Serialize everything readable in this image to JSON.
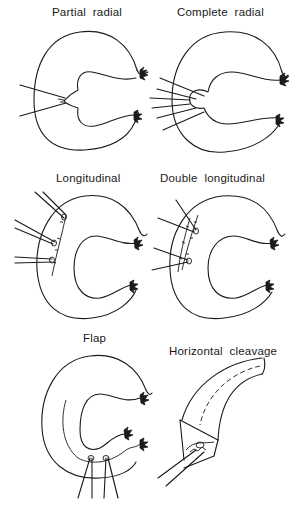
{
  "figure": {
    "panels": [
      {
        "id": "partial-radial",
        "label": "Partial  radial"
      },
      {
        "id": "complete-radial",
        "label": "Complete  radial"
      },
      {
        "id": "longitudinal",
        "label": "Longitudinal"
      },
      {
        "id": "double-longitudinal",
        "label": "Double  longitudinal"
      },
      {
        "id": "flap",
        "label": "Flap"
      },
      {
        "id": "horizontal-cleavage",
        "label": "Horizontal  cleavage"
      }
    ]
  }
}
